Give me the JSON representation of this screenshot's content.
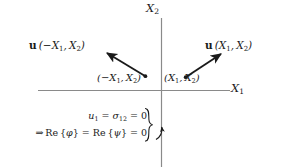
{
  "figure": {
    "axes": {
      "x_axis_label": "X₁",
      "y_axis_label": "X₂",
      "x_axis_name": "X1",
      "y_axis_name": "X2"
    },
    "vectors": [
      {
        "name": "vector-mirrored",
        "label_plain": "u(−X₁, X₂)",
        "bold_symbol": "u",
        "argument": "(−X₁, X₂)",
        "direction": "up-left"
      },
      {
        "name": "vector-original",
        "label_plain": "u(X₁, X₂)",
        "bold_symbol": "u",
        "argument": "(X₁, X₂)",
        "direction": "up-right"
      }
    ],
    "points": [
      {
        "name": "point-mirrored",
        "label": "(−X₁, X₂)"
      },
      {
        "name": "point-original",
        "label": "(X₁, X₂)"
      }
    ],
    "conditions": {
      "line1": "u₁ = σ₁₂ = 0",
      "line2": "⇒ Re{φ} = Re{ψ} = 0",
      "implies_symbol": "⇒"
    },
    "colors": {
      "axis": "#8a8a8a",
      "ink": "#1a1a1a",
      "background": "#ffffff"
    }
  }
}
